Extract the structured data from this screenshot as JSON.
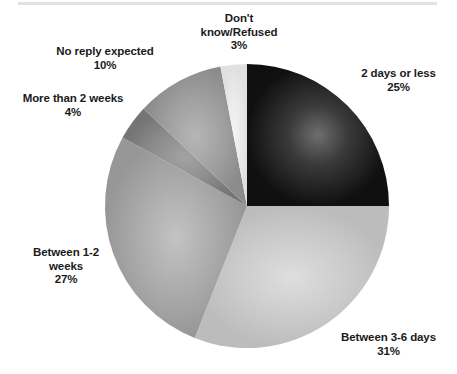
{
  "figure": {
    "background_color": "#ffffff",
    "top_rule_color": "#e2e2e2",
    "label_text_color": "#1a1a1a"
  },
  "chart_data": {
    "type": "pie",
    "title": "",
    "subtitle": "",
    "xlabel": "",
    "ylabel": "",
    "legend_position": "none",
    "grid": false,
    "units": "percent",
    "total": 100,
    "start_angle_deg": 0,
    "direction": "clockwise",
    "center": {
      "x": 247,
      "y": 206
    },
    "radius": 142,
    "categories": [
      "2 days or less",
      "Between 3-6 days",
      "Between 1-2 weeks",
      "More than 2 weeks",
      "No reply expected",
      "Don't know/Refused"
    ],
    "values": [
      25,
      31,
      27,
      4,
      10,
      3
    ],
    "slices": [
      {
        "label": "2 days or less",
        "label_line1": "2 days or less",
        "value": 25,
        "value_label": "25%",
        "color": "#262626",
        "color_inner": "#6b6b6b",
        "color_outer": "#111111",
        "start_deg": 0,
        "end_deg": 90
      },
      {
        "label": "Between 3-6 days",
        "label_line1": "Between 3-6 days",
        "value": 31,
        "value_label": "31%",
        "color": "#c8c8c8",
        "color_inner": "#d9d9d9",
        "color_outer": "#bdbdbd",
        "start_deg": 90,
        "end_deg": 201.6
      },
      {
        "label": "Between 1-2 weeks",
        "label_line1": "Between 1-2",
        "label_line2": "weeks",
        "value": 27,
        "value_label": "27%",
        "color": "#a8a8a8",
        "color_inner": "#bdbdbd",
        "color_outer": "#9a9a9a",
        "start_deg": 201.6,
        "end_deg": 298.8
      },
      {
        "label": "More than 2 weeks",
        "label_line1": "More than 2 weeks",
        "value": 4,
        "value_label": "4%",
        "color": "#8a8a8a",
        "color_inner": "#9e9e9e",
        "color_outer": "#757575",
        "start_deg": 298.8,
        "end_deg": 313.2
      },
      {
        "label": "No reply expected",
        "label_line1": "No reply expected",
        "value": 10,
        "value_label": "10%",
        "color": "#9d9d9d",
        "color_inner": "#b0b0b0",
        "color_outer": "#8d8d8d",
        "start_deg": 313.2,
        "end_deg": 349.2
      },
      {
        "label": "Don't know/Refused",
        "label_line1": "Don't",
        "label_line2": "know/Refused",
        "value": 3,
        "value_label": "3%",
        "color": "#e9e9e9",
        "color_inner": "#f2f2f2",
        "color_outer": "#e2e2e2",
        "start_deg": 349.2,
        "end_deg": 360
      }
    ]
  },
  "labels": {
    "dont_know": {
      "line1": "Don't",
      "line2": "know/Refused",
      "pct": "3%"
    },
    "no_reply": {
      "line1": "No reply expected",
      "pct": "10%"
    },
    "more_than_2_weeks": {
      "line1": "More than 2 weeks",
      "pct": "4%"
    },
    "between_1_2_weeks": {
      "line1": "Between 1-2",
      "line2": "weeks",
      "pct": "27%"
    },
    "between_3_6_days": {
      "line1": "Between 3-6 days",
      "pct": "31%"
    },
    "two_days_or_less": {
      "line1": "2 days or less",
      "pct": "25%"
    }
  }
}
